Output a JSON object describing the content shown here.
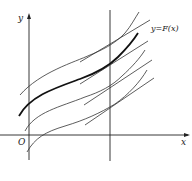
{
  "diagram": {
    "type": "family-of-antiderivative-curves",
    "labels": {
      "y_axis": "y",
      "x_axis": "x",
      "origin": "O",
      "curve": "y=F(x)"
    },
    "colors": {
      "stroke": "#222222",
      "background": "#ffffff"
    },
    "curves": [
      {
        "name": "curve-1",
        "thick": false
      },
      {
        "name": "curve-F",
        "thick": true
      },
      {
        "name": "curve-3",
        "thick": false
      },
      {
        "name": "curve-4",
        "thick": false
      }
    ]
  }
}
